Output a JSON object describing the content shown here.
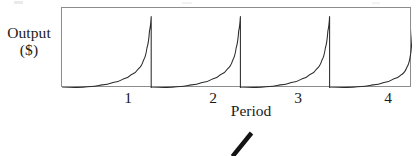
{
  "figure": {
    "name": "output-per-period-sawtooth",
    "axis_color": "#8d8d8d",
    "curve_color": "#2b2b2b",
    "background": "#ffffff"
  },
  "annotations": {
    "artifact_slash_label": "ink-slash-mark"
  },
  "chart_data": {
    "type": "line",
    "title": "",
    "subtitle": "",
    "xlabel": "Period",
    "ylabel": "Output ($)",
    "ylabel_lines": [
      "Output",
      "($)"
    ],
    "xtick_labels": [
      "1",
      "2",
      "3",
      "4"
    ],
    "xtick_values": [
      1,
      2,
      3,
      4
    ],
    "ytick_labels": [],
    "xlim": [
      0,
      4.12
    ],
    "ylim": [
      0,
      1.12
    ],
    "grid": false,
    "legend": false,
    "legend_position": "none",
    "series": [
      {
        "name": "Output",
        "description": "Sawtooth: output grows exponentially within each period then drops to zero at period end",
        "cycles": 4,
        "peak_value": 1.0,
        "trough_value": 0.0,
        "points": [
          {
            "x": 0.0,
            "y": 0.0
          },
          {
            "x": 0.15,
            "y": 0.006
          },
          {
            "x": 0.3,
            "y": 0.018
          },
          {
            "x": 0.45,
            "y": 0.04
          },
          {
            "x": 0.6,
            "y": 0.078
          },
          {
            "x": 0.72,
            "y": 0.125
          },
          {
            "x": 0.82,
            "y": 0.19
          },
          {
            "x": 0.9,
            "y": 0.27
          },
          {
            "x": 0.96,
            "y": 0.39
          },
          {
            "x": 1.0,
            "y": 0.56
          },
          {
            "x": 1.03,
            "y": 0.8
          },
          {
            "x": 1.05,
            "y": 1.0
          },
          {
            "x": 1.05,
            "y": 0.0
          },
          {
            "x": 1.2,
            "y": 0.006
          },
          {
            "x": 1.35,
            "y": 0.018
          },
          {
            "x": 1.5,
            "y": 0.04
          },
          {
            "x": 1.65,
            "y": 0.078
          },
          {
            "x": 1.77,
            "y": 0.125
          },
          {
            "x": 1.87,
            "y": 0.19
          },
          {
            "x": 1.95,
            "y": 0.27
          },
          {
            "x": 2.01,
            "y": 0.39
          },
          {
            "x": 2.05,
            "y": 0.56
          },
          {
            "x": 2.08,
            "y": 0.8
          },
          {
            "x": 2.1,
            "y": 1.0
          },
          {
            "x": 2.1,
            "y": 0.0
          },
          {
            "x": 2.25,
            "y": 0.006
          },
          {
            "x": 2.4,
            "y": 0.018
          },
          {
            "x": 2.55,
            "y": 0.04
          },
          {
            "x": 2.7,
            "y": 0.078
          },
          {
            "x": 2.82,
            "y": 0.125
          },
          {
            "x": 2.92,
            "y": 0.19
          },
          {
            "x": 3.0,
            "y": 0.27
          },
          {
            "x": 3.06,
            "y": 0.39
          },
          {
            "x": 3.1,
            "y": 0.56
          },
          {
            "x": 3.13,
            "y": 0.8
          },
          {
            "x": 3.15,
            "y": 1.0
          },
          {
            "x": 3.15,
            "y": 0.0
          },
          {
            "x": 3.32,
            "y": 0.006
          },
          {
            "x": 3.48,
            "y": 0.018
          },
          {
            "x": 3.64,
            "y": 0.04
          },
          {
            "x": 3.79,
            "y": 0.078
          },
          {
            "x": 3.9,
            "y": 0.125
          },
          {
            "x": 4.0,
            "y": 0.19
          },
          {
            "x": 4.06,
            "y": 0.29
          },
          {
            "x": 4.1,
            "y": 0.45
          },
          {
            "x": 4.12,
            "y": 0.7
          },
          {
            "x": 4.13,
            "y": 1.0
          },
          {
            "x": 4.13,
            "y": 0.0
          }
        ]
      }
    ]
  }
}
